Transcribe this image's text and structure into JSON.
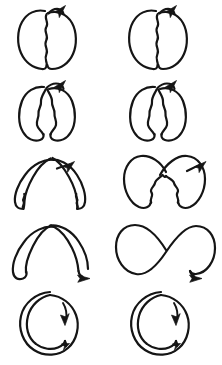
{
  "figure": {
    "title": "Hand-drawn stroke shape transformation sequence",
    "background_color": "#ffffff",
    "ink_color": "#151515",
    "columns": 2,
    "rows": 5,
    "total_panels": 10,
    "stroke_style": "hand-drawn ink line",
    "has_axes": false,
    "has_text_labels": false
  },
  "panels": [
    {
      "id": "panel-r1c1",
      "row": 1,
      "column": 1,
      "shape_name": "double-lobe-bean-closed",
      "description": "Two tall rounded lobes joined along a vertical wavy seam, forming a closed bean or coffee-bean outline.",
      "seam": "wavy vertical",
      "lobes": 2,
      "crossing": false,
      "arrow_position": "top-right",
      "arrow_direction": "up-right"
    },
    {
      "id": "panel-r1c2",
      "row": 1,
      "column": 2,
      "shape_name": "double-lobe-bean-closed",
      "description": "Two tall rounded lobes joined along a vertical wavy seam, forming a closed bean or coffee-bean outline.",
      "seam": "wavy vertical",
      "lobes": 2,
      "crossing": false,
      "arrow_position": "top-right",
      "arrow_direction": "up-right"
    },
    {
      "id": "panel-r2c1",
      "row": 2,
      "column": 1,
      "shape_name": "double-lobe-parted",
      "description": "The two lobes tilt apart at the base while still meeting at a narrow point near the top, leaving a wavy V-shaped gap between them.",
      "seam": "wavy split V",
      "lobes": 2,
      "crossing": false,
      "arrow_position": "top-right",
      "arrow_direction": "up-right"
    },
    {
      "id": "panel-r2c2",
      "row": 2,
      "column": 2,
      "shape_name": "double-lobe-parted",
      "description": "The two lobes tilt apart at the base while still meeting at a narrow point near the top, leaving a wavy V-shaped gap between them.",
      "seam": "wavy split V",
      "lobes": 2,
      "crossing": false,
      "arrow_position": "top-right",
      "arrow_direction": "up-right"
    },
    {
      "id": "panel-r3c1",
      "row": 3,
      "column": 1,
      "shape_name": "wide-arch-crossed",
      "description": "The lobes flatten and splay outward into a wide inverted-V arch whose two strands cross near the apex, with wavy lower edges.",
      "seam": "wavy outer edge",
      "lobes": 2,
      "crossing": true,
      "arrow_position": "upper-right",
      "arrow_direction": "up-right"
    },
    {
      "id": "panel-r3c2",
      "row": 3,
      "column": 2,
      "shape_name": "crossed-lobes-bowtie",
      "description": "Two full rounded lobes swing outward and their strands cross at the centre, producing a bow-tie arrangement with a wavy lower junction.",
      "seam": "wavy centre junction",
      "lobes": 2,
      "crossing": true,
      "arrow_position": "upper-right",
      "arrow_direction": "up-right"
    },
    {
      "id": "panel-r4c1",
      "row": 4,
      "column": 1,
      "shape_name": "open-arch-crossed",
      "description": "A broad smooth arch with the two strands crossing at the apex and the right strand sweeping down into a descending tail.",
      "seam": "smooth",
      "lobes": 2,
      "crossing": true,
      "arrow_position": "lower-right",
      "arrow_direction": "down-right"
    },
    {
      "id": "panel-r4c2",
      "row": 4,
      "column": 2,
      "shape_name": "figure-eight",
      "description": "A complete figure-eight, or lemniscate, with two equal rounded lobes crossing at the centre and a tail leaving to the lower right.",
      "seam": "smooth",
      "lobes": 2,
      "crossing": true,
      "arrow_position": "lower-right",
      "arrow_direction": "down-right"
    },
    {
      "id": "panel-r5c1",
      "row": 5,
      "column": 1,
      "shape_name": "spiral-circle",
      "description": "A single nearly closed circular loop spiralling inward, with an inner arc hooking back along the lower left and an arrowhead inside the upper right.",
      "seam": "smooth",
      "lobes": 1,
      "crossing": true,
      "arrow_position": "inner-upper-right",
      "arrow_direction": "down"
    },
    {
      "id": "panel-r5c2",
      "row": 5,
      "column": 2,
      "shape_name": "spiral-circle",
      "description": "A single nearly closed circular loop spiralling inward, with an inner arc hooking back along the lower left and an arrowhead inside the upper right.",
      "seam": "smooth",
      "lobes": 1,
      "crossing": true,
      "arrow_position": "inner-upper-right",
      "arrow_direction": "down"
    }
  ]
}
